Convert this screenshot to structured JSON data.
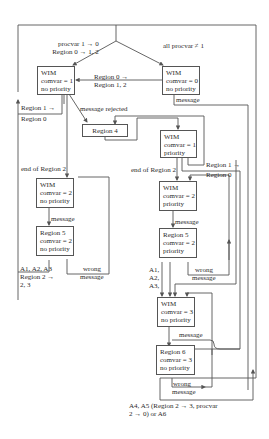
{
  "diagram": {
    "states": {
      "wim0": {
        "lines": [
          "WIM",
          "comvar = 0",
          "no priority"
        ]
      },
      "wim1np": {
        "lines": [
          "WIM",
          "comvar = 1",
          "no priority"
        ]
      },
      "region4": {
        "lines": [
          "Region 4"
        ]
      },
      "wim1p": {
        "lines": [
          "WIM",
          "comvar = 1",
          "priority"
        ]
      },
      "wim2np": {
        "lines": [
          "WIM",
          "comvar = 2",
          "no priority"
        ]
      },
      "region5np": {
        "lines": [
          "Region 5",
          "comvar = 2",
          "no priority"
        ]
      },
      "wim2p": {
        "lines": [
          "WIM",
          "comvar = 2",
          "priority"
        ]
      },
      "region5p": {
        "lines": [
          "Region 5",
          "comvar = 2",
          "priority"
        ]
      },
      "wim3np": {
        "lines": [
          "WIM",
          "comvar = 3",
          "no priority"
        ]
      },
      "region6": {
        "lines": [
          "Region 6",
          "comvar = 3",
          "no priority"
        ]
      }
    },
    "labels": {
      "procvar_top": [
        "procvar 1 → 0",
        "Region 0 → 1, 2"
      ],
      "all_procvar": "all procvar ≠ 1",
      "region0_to_12": [
        "Region 0 →",
        "Region 1, 2"
      ],
      "message_top": "message",
      "region1_to_0_left": [
        "Region 1 →",
        "Region 0"
      ],
      "message_rejected": "message rejected",
      "end_region2_left": "end of Region 2",
      "end_region2_right": "end of Region 2",
      "region1_to_0_right": [
        "Region 1 →",
        "Region 0"
      ],
      "message_left": "message",
      "message_right": "message",
      "wrong_message_left": [
        "wrong",
        "message"
      ],
      "wrong_message_right": [
        "wrong",
        "message"
      ],
      "a123_left": [
        "A1, A2, A3",
        "Region 2 →",
        "2, 3"
      ],
      "a123_right": [
        "A1,",
        "A2,",
        "A3,"
      ],
      "message_lower": "message",
      "wrong_message_lower": [
        "wrong",
        "message"
      ],
      "bottom_note": [
        "A4, A5 (Region 2 → 3, procvar",
        "2 → 0) or A6"
      ]
    }
  }
}
